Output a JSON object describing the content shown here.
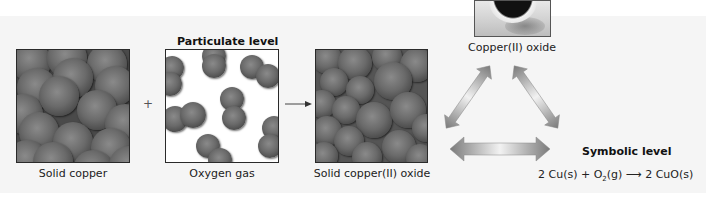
{
  "title": "Particulate level",
  "operators": {
    "plus": "+",
    "yields": "⟶"
  },
  "panels": [
    {
      "id": "solid-copper",
      "label": "Solid copper",
      "kind": "packed-spheres"
    },
    {
      "id": "oxygen-gas",
      "label": "Oxygen gas",
      "kind": "diatomic-molecules"
    },
    {
      "id": "solid-copper-oxide",
      "label": "Solid copper(II) oxide",
      "kind": "packed-spheres"
    }
  ],
  "macroscopic": {
    "label": "Copper(II) oxide",
    "image": "copper-oxide-dish-photo"
  },
  "symbolic": {
    "heading": "Symbolic level",
    "equation": {
      "left1": "2 Cu(s) + O",
      "sub": "2",
      "left2": "(g)",
      "arrow": "⟶",
      "right": "2 CuO(s)"
    }
  },
  "triangle_arrows": [
    "left-diagonal-double-arrow",
    "right-diagonal-double-arrow",
    "bottom-horizontal-double-arrow"
  ],
  "colors": {
    "background": "#f5f5f5",
    "sphere": "#6a6a6a",
    "border": "#2a2a2a",
    "arrow_light": "#f0f0f0",
    "arrow_dark": "#777777"
  }
}
